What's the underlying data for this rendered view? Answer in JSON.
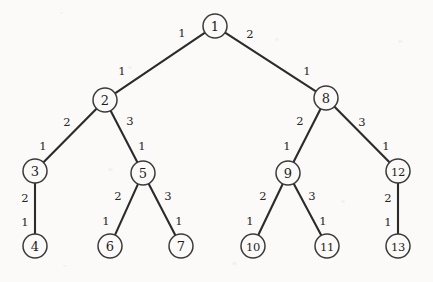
{
  "figure": {
    "kind": "weighted-tree-diagram",
    "background_color": "#fbfaf8",
    "stroke_color": "#2b2b2b",
    "node_fill": "#fbfaf8",
    "node_radius": 12,
    "width": 433,
    "height": 282
  },
  "nodes": [
    {
      "id": "1",
      "label": "1",
      "x": 215,
      "y": 26,
      "r": 12
    },
    {
      "id": "2",
      "label": "2",
      "x": 105,
      "y": 100,
      "r": 12
    },
    {
      "id": "8",
      "label": "8",
      "x": 326,
      "y": 98,
      "r": 12
    },
    {
      "id": "3",
      "label": "3",
      "x": 35,
      "y": 171,
      "r": 12
    },
    {
      "id": "5",
      "label": "5",
      "x": 143,
      "y": 173,
      "r": 12
    },
    {
      "id": "9",
      "label": "9",
      "x": 288,
      "y": 173,
      "r": 12
    },
    {
      "id": "12",
      "label": "12",
      "x": 398,
      "y": 171,
      "r": 12
    },
    {
      "id": "4",
      "label": "4",
      "x": 35,
      "y": 246,
      "r": 12
    },
    {
      "id": "6",
      "label": "6",
      "x": 110,
      "y": 246,
      "r": 12
    },
    {
      "id": "7",
      "label": "7",
      "x": 181,
      "y": 246,
      "r": 12
    },
    {
      "id": "10",
      "label": "10",
      "x": 253,
      "y": 246,
      "r": 12
    },
    {
      "id": "11",
      "label": "11",
      "x": 327,
      "y": 246,
      "r": 12
    },
    {
      "id": "13",
      "label": "13",
      "x": 398,
      "y": 246,
      "r": 12
    }
  ],
  "edges": [
    {
      "from": "1",
      "to": "2",
      "label_from": "1",
      "label_to": "1",
      "from_label_x": 182,
      "from_label_y": 33,
      "to_label_x": 122,
      "to_label_y": 71
    },
    {
      "from": "1",
      "to": "8",
      "label_from": "2",
      "label_to": "1",
      "from_label_x": 250,
      "from_label_y": 34,
      "to_label_x": 307,
      "to_label_y": 71
    },
    {
      "from": "2",
      "to": "3",
      "label_from": "2",
      "label_to": "1",
      "from_label_x": 67,
      "from_label_y": 122,
      "to_label_x": 43,
      "to_label_y": 146
    },
    {
      "from": "2",
      "to": "5",
      "label_from": "3",
      "label_to": "1",
      "from_label_x": 130,
      "from_label_y": 121,
      "to_label_x": 142,
      "to_label_y": 146
    },
    {
      "from": "8",
      "to": "9",
      "label_from": "2",
      "label_to": "1",
      "from_label_x": 300,
      "from_label_y": 121,
      "to_label_x": 287,
      "to_label_y": 146
    },
    {
      "from": "8",
      "to": "12",
      "label_from": "3",
      "label_to": "1",
      "from_label_x": 362,
      "from_label_y": 122,
      "to_label_x": 386,
      "to_label_y": 146
    },
    {
      "from": "3",
      "to": "4",
      "label_from": "2",
      "label_to": "1",
      "from_label_x": 25,
      "from_label_y": 198,
      "to_label_x": 25,
      "to_label_y": 222
    },
    {
      "from": "5",
      "to": "6",
      "label_from": "2",
      "label_to": "1",
      "from_label_x": 118,
      "from_label_y": 196,
      "to_label_x": 106,
      "to_label_y": 221
    },
    {
      "from": "5",
      "to": "7",
      "label_from": "3",
      "label_to": "1",
      "from_label_x": 168,
      "from_label_y": 196,
      "to_label_x": 179,
      "to_label_y": 221
    },
    {
      "from": "9",
      "to": "10",
      "label_from": "2",
      "label_to": "1",
      "from_label_x": 263,
      "from_label_y": 196,
      "to_label_x": 250,
      "to_label_y": 221
    },
    {
      "from": "9",
      "to": "11",
      "label_from": "3",
      "label_to": "1",
      "from_label_x": 312,
      "from_label_y": 196,
      "to_label_x": 323,
      "to_label_y": 221
    },
    {
      "from": "12",
      "to": "13",
      "label_from": "2",
      "label_to": "1",
      "from_label_x": 388,
      "from_label_y": 198,
      "to_label_x": 388,
      "to_label_y": 222
    }
  ]
}
